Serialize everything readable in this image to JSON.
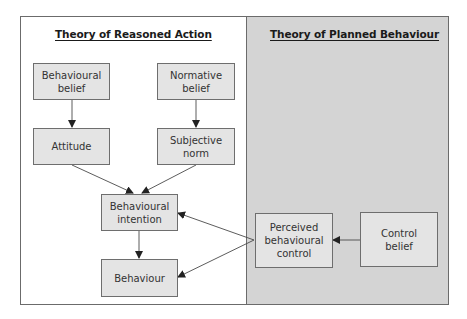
{
  "diagram": {
    "panels": {
      "left": {
        "title": "Theory of Reasoned Action",
        "background": "#ffffff"
      },
      "right": {
        "title": "Theory of Planned Behaviour",
        "background": "#d4d4d4"
      }
    },
    "nodes": {
      "behavioural_belief": {
        "label": "Behavioural belief"
      },
      "normative_belief": {
        "label": "Normative belief"
      },
      "attitude": {
        "label": "Attitude"
      },
      "subjective_norm": {
        "label": "Subjective norm"
      },
      "behavioural_intention": {
        "label": "Behavioural intention"
      },
      "behaviour": {
        "label": "Behaviour"
      },
      "perceived_behavioural_control": {
        "label": "Perceived behavioural control"
      },
      "control_belief": {
        "label": "Control belief"
      }
    },
    "edges": [
      {
        "from": "Behavioural belief",
        "to": "Attitude"
      },
      {
        "from": "Normative belief",
        "to": "Subjective norm"
      },
      {
        "from": "Attitude",
        "to": "Behavioural intention"
      },
      {
        "from": "Subjective norm",
        "to": "Behavioural intention"
      },
      {
        "from": "Behavioural intention",
        "to": "Behaviour"
      },
      {
        "from": "Perceived behavioural control",
        "to": "Behavioural intention"
      },
      {
        "from": "Perceived behavioural control",
        "to": "Behaviour"
      },
      {
        "from": "Control belief",
        "to": "Perceived behavioural control"
      }
    ],
    "colors": {
      "box_fill": "#e4e4e4",
      "box_border": "#6e6e6e",
      "line": "#4a4a4a"
    }
  }
}
